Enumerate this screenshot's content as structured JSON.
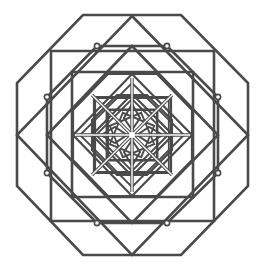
{
  "figure": {
    "title": "",
    "width": 264,
    "height": 274,
    "center": [
      132,
      135
    ],
    "colors": {
      "background": "#ffffff",
      "stroke": "#4a4a4a",
      "highlight": "#ffffff"
    },
    "stroke_width": 2.6,
    "inner_stroke_width": 2.2
  },
  "shapes": {
    "outer_octagon": [
      [
        83,
        15
      ],
      [
        181,
        15
      ],
      [
        248,
        83
      ],
      [
        248,
        186
      ],
      [
        181,
        255
      ],
      [
        83,
        255
      ],
      [
        17,
        186
      ],
      [
        17,
        83
      ]
    ],
    "outer_diamond": [
      [
        132,
        16
      ],
      [
        248,
        135
      ],
      [
        132,
        255
      ],
      [
        17,
        135
      ]
    ],
    "square_1": [
      [
        51,
        51
      ],
      [
        214,
        51
      ],
      [
        214,
        221
      ],
      [
        51,
        221
      ]
    ],
    "octagon_2": [
      [
        97,
        46
      ],
      [
        167,
        46
      ],
      [
        218,
        97
      ],
      [
        218,
        173
      ],
      [
        167,
        223
      ],
      [
        97,
        223
      ],
      [
        47,
        173
      ],
      [
        47,
        97
      ]
    ],
    "diamond_2": [
      [
        132,
        46
      ],
      [
        218,
        135
      ],
      [
        132,
        223
      ],
      [
        47,
        135
      ]
    ],
    "square_2": [
      [
        72,
        72
      ],
      [
        193,
        72
      ],
      [
        193,
        197
      ],
      [
        72,
        197
      ]
    ],
    "octagon_3": [
      [
        108,
        74
      ],
      [
        157,
        74
      ],
      [
        192,
        110
      ],
      [
        192,
        160
      ],
      [
        157,
        196
      ],
      [
        108,
        196
      ],
      [
        73,
        160
      ],
      [
        73,
        110
      ]
    ],
    "diamond_3": [
      [
        132,
        74
      ],
      [
        192,
        135
      ],
      [
        132,
        196
      ],
      [
        73,
        135
      ]
    ],
    "square_3": [
      [
        94,
        97
      ],
      [
        171,
        97
      ],
      [
        171,
        173
      ],
      [
        94,
        173
      ]
    ],
    "octagon_4": [
      [
        117,
        95
      ],
      [
        147,
        95
      ],
      [
        172,
        120
      ],
      [
        172,
        150
      ],
      [
        147,
        175
      ],
      [
        117,
        175
      ],
      [
        92,
        150
      ],
      [
        92,
        120
      ]
    ],
    "square_4": [
      [
        108,
        110
      ],
      [
        157,
        110
      ],
      [
        157,
        160
      ],
      [
        108,
        160
      ]
    ],
    "diamond_4": [
      [
        132,
        94
      ],
      [
        173,
        135
      ],
      [
        132,
        176
      ],
      [
        92,
        135
      ]
    ]
  },
  "spokes": [
    [
      [
        132,
        78
      ],
      [
        132,
        192
      ]
    ],
    [
      [
        76,
        135
      ],
      [
        189,
        135
      ]
    ],
    [
      [
        92,
        95
      ],
      [
        172,
        175
      ]
    ],
    [
      [
        172,
        95
      ],
      [
        92,
        175
      ]
    ]
  ],
  "star_petals": [
    [
      [
        132,
        104
      ],
      [
        140,
        118
      ],
      [
        132,
        130
      ],
      [
        124,
        118
      ]
    ],
    [
      [
        163,
        135
      ],
      [
        149,
        143
      ],
      [
        137,
        135
      ],
      [
        149,
        127
      ]
    ],
    [
      [
        132,
        166
      ],
      [
        124,
        152
      ],
      [
        132,
        140
      ],
      [
        140,
        152
      ]
    ],
    [
      [
        101,
        135
      ],
      [
        115,
        127
      ],
      [
        127,
        135
      ],
      [
        115,
        143
      ]
    ]
  ],
  "nodes": [
    [
      97,
      46
    ],
    [
      167,
      46
    ],
    [
      218,
      97
    ],
    [
      218,
      173
    ],
    [
      167,
      223
    ],
    [
      97,
      223
    ],
    [
      47,
      173
    ],
    [
      47,
      97
    ]
  ]
}
